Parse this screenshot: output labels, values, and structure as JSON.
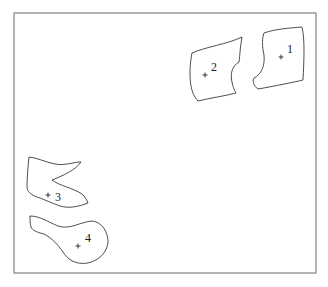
{
  "figure": {
    "frame": {
      "x": 14,
      "y": 13,
      "width": 302,
      "height": 260,
      "color": "#8a8a8a"
    },
    "regions": [
      {
        "id": "1",
        "label": "1",
        "centroid": [
          281,
          57
        ],
        "label_pos": [
          287,
          53
        ],
        "outline": "M264,33 C275,29 290,28 302,27 C305,40 304,60 303,80 C295,82 275,86 258,89 C254,86 252,82 254,78 C262,74 265,65 264,55 C262,46 262,38 264,33 Z"
      },
      {
        "id": "2",
        "label": "2",
        "centroid": [
          205,
          75
        ],
        "label_pos": [
          211,
          71
        ],
        "outline": "M192,53 C205,47 228,44 242,37 C240,48 240,55 239,62 C232,66 230,74 232,82 C233,88 235,91 236,93 C225,96 210,98 198,101 C192,95 190,85 190,74 C190,65 191,58 192,53 Z"
      },
      {
        "id": "3",
        "label": "3",
        "centroid": [
          48,
          195
        ],
        "label_pos": [
          55,
          201
        ],
        "outline": "M29,157 C38,158 45,162 55,164 C65,166 73,162 81,162 C76,170 62,176 52,180 C60,186 73,188 82,194 C85,197 87,200 88,203 C80,206 70,209 60,206 C52,203 45,200 40,198 C33,196 28,193 27,188 C27,178 28,166 29,157 Z"
      },
      {
        "id": "4",
        "label": "4",
        "centroid": [
          78,
          246
        ],
        "label_pos": [
          85,
          242
        ],
        "outline": "M30,216 C40,216 48,222 58,226 C70,230 80,222 92,221 C102,222 108,232 108,242 C107,252 100,260 88,263 C76,265 68,260 63,252 C58,245 52,238 44,234 C36,232 32,230 31,227 C30,224 30,220 30,216 Z"
      }
    ]
  }
}
